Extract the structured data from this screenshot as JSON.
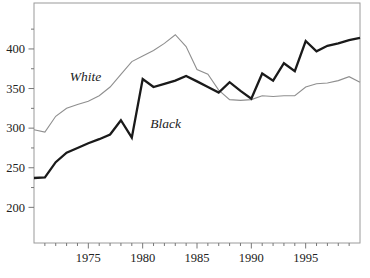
{
  "figure": {
    "background": "#ffffff",
    "frame_color": "#9a9a9a",
    "tick_color": "#777777",
    "label_color": "#222222"
  },
  "chart_data": {
    "type": "line",
    "title": "",
    "xlabel": "",
    "ylabel": "",
    "grid": false,
    "legend_position": "inline-annotations",
    "xlim": [
      1970,
      2000
    ],
    "ylim": [
      155,
      458
    ],
    "xticks": [
      1975,
      1980,
      1985,
      1990,
      1995
    ],
    "xticks_minor": [
      1971,
      1972,
      1973,
      1974,
      1976,
      1977,
      1978,
      1979,
      1981,
      1982,
      1983,
      1984,
      1986,
      1987,
      1988,
      1989,
      1991,
      1992,
      1993,
      1994,
      1996,
      1997,
      1998,
      1999
    ],
    "yticks": [
      200,
      250,
      300,
      350,
      400
    ],
    "yticks_minor": [
      225,
      275,
      325,
      375,
      425
    ],
    "x": [
      1970,
      1971,
      1972,
      1973,
      1974,
      1975,
      1976,
      1977,
      1978,
      1979,
      1980,
      1981,
      1982,
      1983,
      1984,
      1985,
      1986,
      1987,
      1988,
      1989,
      1990,
      1991,
      1992,
      1993,
      1994,
      1995,
      1996,
      1997,
      1998,
      1999,
      2000
    ],
    "series": [
      {
        "name": "White",
        "color": "#8f8f8f",
        "stroke_width": 1.1,
        "values": [
          298,
          295,
          315,
          325,
          330,
          334,
          341,
          352,
          368,
          384,
          391,
          398,
          407,
          418,
          403,
          374,
          368,
          348,
          336,
          335,
          336,
          341,
          340,
          341,
          341,
          352,
          356,
          357,
          360,
          365,
          358
        ]
      },
      {
        "name": "Black",
        "color": "#1a1a1a",
        "stroke_width": 2.3,
        "values": [
          237,
          238,
          257,
          269,
          275,
          281,
          286,
          292,
          310,
          288,
          362,
          352,
          356,
          360,
          366,
          359,
          352,
          345,
          358,
          347,
          337,
          369,
          360,
          382,
          372,
          410,
          397,
          404,
          407,
          411,
          414
        ]
      }
    ],
    "annotations": [
      {
        "text": "White",
        "x": 1973.3,
        "y": 360
      },
      {
        "text": "Black",
        "x": 1980.7,
        "y": 300
      }
    ]
  }
}
